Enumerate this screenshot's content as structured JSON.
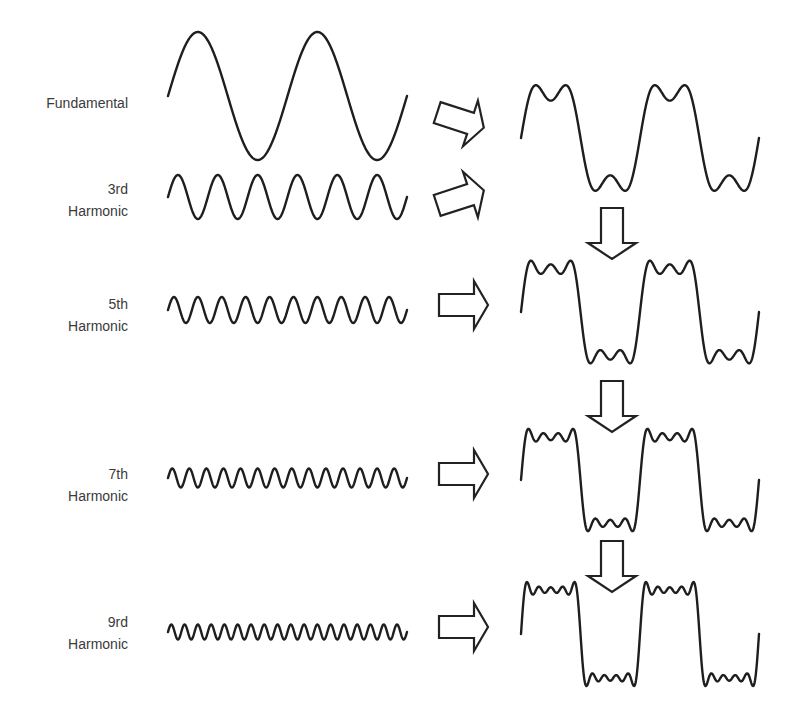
{
  "diagram": {
    "rows": [
      {
        "id": "fundamental",
        "label_lines": [
          "Fundamental"
        ],
        "harmonic": 1,
        "label_top": 92,
        "wave": {
          "x0": 168,
          "x1": 407,
          "mid": 96,
          "amp": 64
        }
      },
      {
        "id": "3rd",
        "label_lines": [
          "3rd",
          "Harmonic"
        ],
        "harmonic": 3,
        "label_top": 178,
        "wave": {
          "x0": 168,
          "x1": 407,
          "mid": 197,
          "amp": 22
        }
      },
      {
        "id": "5th",
        "label_lines": [
          "5th",
          "Harmonic"
        ],
        "harmonic": 5,
        "label_top": 293,
        "wave": {
          "x0": 168,
          "x1": 407,
          "mid": 310,
          "amp": 13
        }
      },
      {
        "id": "7th",
        "label_lines": [
          "7th",
          "Harmonic"
        ],
        "harmonic": 7,
        "label_top": 463,
        "wave": {
          "x0": 168,
          "x1": 407,
          "mid": 478,
          "amp": 9.5
        }
      },
      {
        "id": "9th",
        "label_lines": [
          "9rd",
          "Harmonic"
        ],
        "harmonic": 9,
        "label_top": 611,
        "wave": {
          "x0": 168,
          "x1": 407,
          "mid": 632,
          "amp": 7.5
        }
      }
    ],
    "sums": [
      {
        "id": "sum-1-3",
        "harmonics": [
          1,
          3
        ],
        "x0": 521,
        "x1": 759,
        "mid": 138,
        "scale": 56
      },
      {
        "id": "sum-1-5",
        "harmonics": [
          1,
          3,
          5
        ],
        "x0": 521,
        "x1": 759,
        "mid": 312,
        "scale": 55
      },
      {
        "id": "sum-1-7",
        "harmonics": [
          1,
          3,
          5,
          7
        ],
        "x0": 521,
        "x1": 759,
        "mid": 480,
        "scale": 55
      },
      {
        "id": "sum-1-9",
        "harmonics": [
          1,
          3,
          5,
          7,
          9
        ],
        "x0": 521,
        "x1": 759,
        "mid": 634,
        "scale": 56
      }
    ],
    "cycles": 2,
    "arrows": [
      {
        "id": "arrow-fundamental",
        "type": "right",
        "cx": 460,
        "cy": 120,
        "rotate": 18
      },
      {
        "id": "arrow-3rd",
        "type": "right",
        "cx": 460,
        "cy": 198,
        "rotate": -18
      },
      {
        "id": "arrow-5th",
        "type": "right",
        "cx": 463,
        "cy": 305,
        "rotate": 0
      },
      {
        "id": "arrow-7th",
        "type": "right",
        "cx": 463,
        "cy": 474,
        "rotate": 0
      },
      {
        "id": "arrow-9th",
        "type": "right",
        "cx": 463,
        "cy": 627,
        "rotate": 0
      },
      {
        "id": "arrow-down-1",
        "type": "down",
        "cx": 612,
        "cy": 233,
        "rotate": 0
      },
      {
        "id": "arrow-down-2",
        "type": "down",
        "cx": 612,
        "cy": 406,
        "rotate": 0
      },
      {
        "id": "arrow-down-3",
        "type": "down",
        "cx": 612,
        "cy": 566,
        "rotate": 0
      }
    ],
    "colors": {
      "stroke": "#1e1e1e",
      "label": "#3a3a3a",
      "background": "#ffffff"
    }
  }
}
